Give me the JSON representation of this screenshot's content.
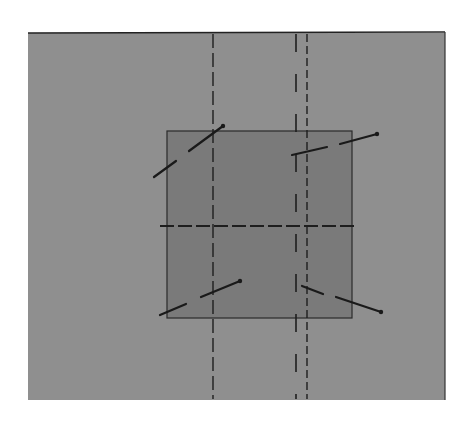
{
  "diagram": {
    "canvas": {
      "width": 476,
      "height": 422,
      "background": "#ffffff"
    },
    "outer_panel": {
      "x": 28,
      "y": 33,
      "width": 417,
      "height": 367,
      "fill": "#8f8f8f",
      "top_border_color": "#222222",
      "right_border_color": "#333333"
    },
    "inner_square": {
      "x": 167,
      "y": 131,
      "width": 185,
      "height": 187,
      "fill": "#7a7a7a",
      "stroke": "#2a2a2a"
    },
    "dashed_lines": [
      {
        "id": "vertical-left",
        "x1": 213,
        "y1": 34,
        "x2": 213,
        "y2": 399,
        "dash": "14 5",
        "color": "#1e1e1e",
        "width": 1.4
      },
      {
        "id": "vertical-center",
        "x1": 296,
        "y1": 34,
        "x2": 296,
        "y2": 399,
        "dash": "18 22",
        "color": "#1e1e1e",
        "width": 1.6
      },
      {
        "id": "vertical-right",
        "x1": 307,
        "y1": 34,
        "x2": 307,
        "y2": 399,
        "dash": "8 4",
        "color": "#1e1e1e",
        "width": 1.4
      },
      {
        "id": "horizontal-center",
        "x1": 160,
        "y1": 226,
        "x2": 356,
        "y2": 226,
        "dash": "14 4",
        "color": "#1e1e1e",
        "width": 1.8
      }
    ],
    "segments": [
      {
        "id": "top-left-pin",
        "parts": [
          {
            "x1": 154,
            "y1": 177,
            "x2": 176,
            "y2": 161
          },
          {
            "x1": 189,
            "y1": 151,
            "x2": 223,
            "y2": 126
          }
        ],
        "head": {
          "x": 223,
          "y": 126
        }
      },
      {
        "id": "top-right-pin",
        "parts": [
          {
            "x1": 292,
            "y1": 155,
            "x2": 327,
            "y2": 147
          },
          {
            "x1": 340,
            "y1": 144,
            "x2": 377,
            "y2": 134
          }
        ],
        "head": {
          "x": 377,
          "y": 134
        }
      },
      {
        "id": "bottom-left-pin",
        "parts": [
          {
            "x1": 160,
            "y1": 315,
            "x2": 186,
            "y2": 304
          },
          {
            "x1": 201,
            "y1": 297,
            "x2": 240,
            "y2": 281
          }
        ],
        "head": {
          "x": 240,
          "y": 281
        }
      },
      {
        "id": "bottom-right-pin",
        "parts": [
          {
            "x1": 302,
            "y1": 286,
            "x2": 323,
            "y2": 294
          },
          {
            "x1": 336,
            "y1": 297,
            "x2": 381,
            "y2": 312
          }
        ],
        "head": {
          "x": 381,
          "y": 312
        }
      }
    ],
    "segment_color": "#1a1a1a",
    "segment_width": 2.2
  }
}
